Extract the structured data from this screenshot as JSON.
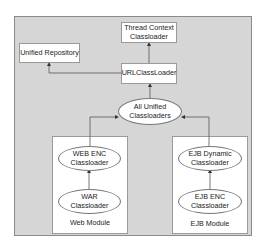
{
  "nodes": {
    "thread_context": "Thread Context\nClassloader",
    "unified_repository": "Unified Repository",
    "url_classloader": "URLClassLoader",
    "all_unified": "All Unified\nClassloaders",
    "web_enc": "WEB ENC\nClassloader",
    "war": "WAR\nClassloader",
    "ejb_dynamic": "EJB Dynamic\nClassloader",
    "ejb_enc": "EJB ENC\nClassloader"
  },
  "modules": {
    "web": "Web Module",
    "ejb": "EJB Module"
  },
  "colors": {
    "frame_bg": "#d6d6d6",
    "frame_border": "#8a8a8a",
    "node_bg": "#ffffff",
    "line": "#555555"
  }
}
